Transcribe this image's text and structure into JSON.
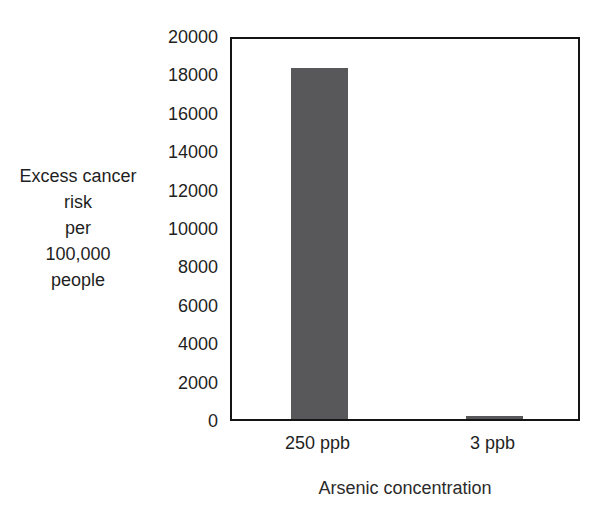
{
  "chart_data": {
    "type": "bar",
    "title": "",
    "subtitle": "",
    "categories": [
      "250 ppb",
      "3 ppb"
    ],
    "values": [
      18300,
      150
    ],
    "xlabel": "Arsenic concentration",
    "ylabel": "Excess cancer risk\nper\n100,000\npeople",
    "ylabel_lines": [
      "Excess",
      "cancer risk",
      "per",
      "100,000",
      "people"
    ],
    "ylim": [
      0,
      20000
    ],
    "ytick_labels": [
      "20000",
      "18000",
      "16000",
      "14000",
      "12000",
      "10000",
      "8000",
      "6000",
      "4000",
      "2000",
      "0"
    ],
    "ytick_values": [
      20000,
      18000,
      16000,
      14000,
      12000,
      10000,
      8000,
      6000,
      4000,
      2000,
      0
    ],
    "ytick_step": 2000,
    "grid": false,
    "legend": false,
    "legend_position": "none",
    "bar_color": "#58585a",
    "axis_color": "#141414",
    "background_color": "#ffffff",
    "bar_width_fraction": 0.33,
    "annotations": []
  }
}
